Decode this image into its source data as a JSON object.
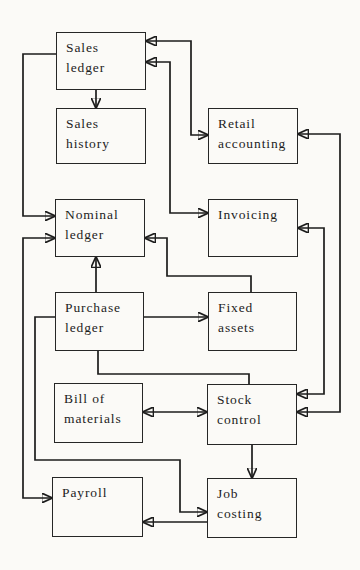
{
  "figure": {
    "type": "flow-diagram",
    "description_colors": {
      "background": "#fbfaf7",
      "line_color": "#1c1c1c",
      "box_border_color": "#262626",
      "text_color": "#1d1d1d"
    },
    "nodes": {
      "sales_ledger": {
        "label": "Sales\nledger"
      },
      "sales_history": {
        "label": "Sales\nhistory"
      },
      "retail_accounting": {
        "label": "Retail\naccounting"
      },
      "nominal_ledger": {
        "label": "Nominal\nledger"
      },
      "invoicing": {
        "label": "Invoicing"
      },
      "purchase_ledger": {
        "label": "Purchase\nledger"
      },
      "fixed_assets": {
        "label": "Fixed\nassets"
      },
      "bill_of_materials": {
        "label": "Bill of\nmaterials"
      },
      "stock_control": {
        "label": "Stock\ncontrol"
      },
      "payroll": {
        "label": "Payroll"
      },
      "job_costing": {
        "label": "Job\ncosting"
      }
    },
    "connections": [
      {
        "from": "sales_ledger",
        "to": "retail_accounting",
        "style": "bidirectional"
      },
      {
        "from": "sales_ledger",
        "to": "invoicing",
        "style": "bidirectional"
      },
      {
        "from": "sales_ledger",
        "to": "sales_history",
        "style": "forward"
      },
      {
        "from": "sales_ledger",
        "to": "nominal_ledger",
        "style": "forward"
      },
      {
        "from": "payroll",
        "to": "nominal_ledger",
        "style": "bidirectional"
      },
      {
        "from": "purchase_ledger",
        "to": "nominal_ledger",
        "style": "forward"
      },
      {
        "from": "fixed_assets",
        "to": "nominal_ledger",
        "style": "forward"
      },
      {
        "from": "purchase_ledger",
        "to": "fixed_assets",
        "style": "forward"
      },
      {
        "from": "purchase_ledger",
        "to": "stock_control",
        "style": "plain-line"
      },
      {
        "from": "purchase_ledger",
        "to": "job_costing",
        "style": "forward"
      },
      {
        "from": "bill_of_materials",
        "to": "stock_control",
        "style": "bidirectional"
      },
      {
        "from": "stock_control",
        "to": "job_costing",
        "style": "forward"
      },
      {
        "from": "job_costing",
        "to": "payroll",
        "style": "forward"
      },
      {
        "from": "invoicing",
        "to": "stock_control",
        "style": "bidirectional"
      },
      {
        "from": "retail_accounting",
        "to": "stock_control",
        "style": "bidirectional"
      }
    ]
  }
}
